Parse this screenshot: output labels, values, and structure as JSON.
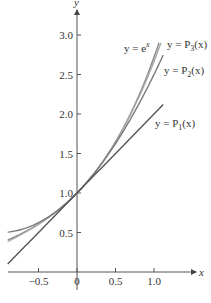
{
  "chart_data": {
    "type": "line",
    "title": "",
    "xlabel": "x",
    "ylabel": "y",
    "xlim": [
      -0.9,
      1.2
    ],
    "ylim": [
      0,
      3.3
    ],
    "grid": false,
    "xticks": [
      -0.5,
      0,
      0.5,
      1.0
    ],
    "xtick_labels": [
      "−0.5",
      "0",
      "0.5",
      "1.0"
    ],
    "yticks": [
      0.5,
      1.0,
      1.5,
      2.0,
      2.5,
      3.0
    ],
    "ytick_labels": [
      "0.5",
      "1.0",
      "1.5",
      "2.0",
      "2.5",
      "3.0"
    ],
    "series": [
      {
        "name": "y = e^x",
        "label_main": "y = e",
        "label_sup": "x",
        "function": "exp",
        "x_range": [
          -0.9,
          1.065
        ],
        "color": "#8a8a8a"
      },
      {
        "name": "y = P3(x)",
        "label_main": "y = P",
        "label_sub": "3",
        "label_tail": "(x)",
        "function": "P3",
        "x_range": [
          -0.9,
          1.09
        ],
        "color": "#a8a8a8"
      },
      {
        "name": "y = P2(x)",
        "label_main": "y = P",
        "label_sub": "2",
        "label_tail": "(x)",
        "function": "P2",
        "x_range": [
          -0.9,
          1.12
        ],
        "color": "#7a7a7a"
      },
      {
        "name": "y = P1(x)",
        "label_main": "y = P",
        "label_sub": "1",
        "label_tail": "(x)",
        "function": "P1",
        "x_range": [
          -0.9,
          1.12
        ],
        "color": "#555555"
      }
    ],
    "sample_points": {
      "x": [
        -0.9,
        -0.5,
        0,
        0.5,
        1.0
      ],
      "exp": [
        0.41,
        0.61,
        1.0,
        1.65,
        2.72
      ],
      "P1": [
        0.1,
        0.5,
        1.0,
        1.5,
        2.0
      ],
      "P2": [
        0.51,
        0.63,
        1.0,
        1.63,
        2.5
      ],
      "P3": [
        0.38,
        0.6,
        1.0,
        1.65,
        2.67
      ]
    }
  }
}
